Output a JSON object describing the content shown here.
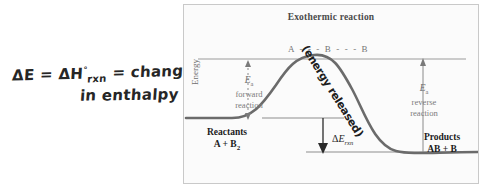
{
  "annotation": {
    "line1_pre": "ΔE = ΔH",
    "line1_sup": "°",
    "line1_sub": "rxn",
    "line1_post": " = change",
    "line2": "in enthalpy"
  },
  "figure": {
    "title": "Exothermic reaction",
    "axis_label_y": "Energy",
    "transition_state": "A - - - B - - - B",
    "ea_forward": {
      "symbol": "E",
      "symbol_sub": "a",
      "line1": "forward",
      "line2": "reaction"
    },
    "ea_reverse": {
      "symbol": "E",
      "symbol_sub": "a",
      "line1": "reverse",
      "line2": "reaction"
    },
    "reactants": {
      "heading": "Reactants",
      "formula_pre": "A + B",
      "formula_sub": "2"
    },
    "products": {
      "heading": "Products",
      "formula": "AB + B"
    },
    "delta_e": {
      "delta": "Δ",
      "symbol": "E",
      "sub": "rxn"
    },
    "handwritten_curve_note": "(energy released)",
    "colors": {
      "curve": "#6b6b6b",
      "level_line": "#8d8d8d",
      "arrow": "#7a7a7a",
      "text_dark": "#1c1c1c",
      "text_gray": "#757575",
      "frame": "#c9c9c9",
      "background": "#fbfbfb",
      "handwriting": "#262626"
    }
  }
}
